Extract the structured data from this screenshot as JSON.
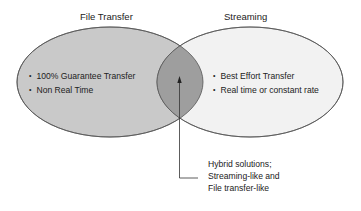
{
  "diagram": {
    "type": "venn",
    "left_set": {
      "title": "File Transfer",
      "items": [
        "100% Guarantee Transfer",
        "Non Real Time"
      ],
      "fill": "#c9c9c9"
    },
    "right_set": {
      "title": "Streaming",
      "items": [
        "Best Effort Transfer",
        "Real time or constant rate"
      ],
      "fill": "#f2f2f2"
    },
    "overlap": {
      "fill": "#9e9e9e",
      "callout_lines": [
        "Hybrid solutions;",
        "Streaming-like and",
        "File transfer-like"
      ]
    },
    "stroke": "#555555"
  }
}
